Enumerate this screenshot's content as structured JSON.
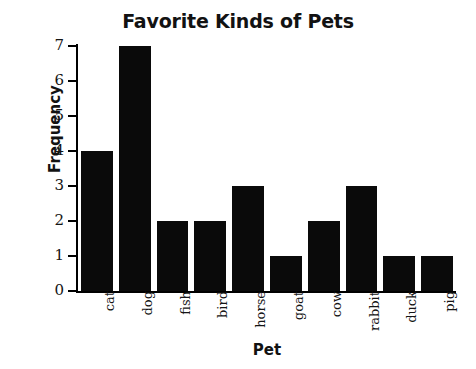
{
  "chart_data": {
    "type": "bar",
    "title": "Favorite Kinds of Pets",
    "xlabel": "Pet",
    "ylabel": "Frequency",
    "categories": [
      "cat",
      "dog",
      "fish",
      "bird",
      "horse",
      "goat",
      "cow",
      "rabbit",
      "duck",
      "pig"
    ],
    "values": [
      4,
      7,
      2,
      2,
      3,
      1,
      2,
      3,
      1,
      1
    ],
    "ylim": [
      0,
      7
    ],
    "yticks": [
      0,
      1,
      2,
      3,
      4,
      5,
      6,
      7
    ],
    "ytick_labels": [
      "0",
      "1",
      "2",
      "3",
      "4",
      "5",
      "6",
      "7"
    ],
    "grid": false,
    "legend": "none",
    "bar_color": "#0a0a0a",
    "axis_color": "#000000",
    "background_color": "#ffffff"
  }
}
